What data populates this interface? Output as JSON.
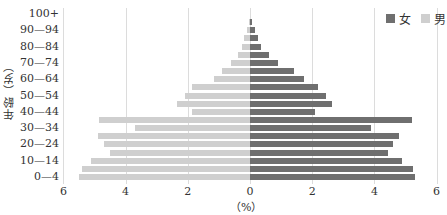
{
  "chart_data": {
    "type": "bar",
    "orientation": "horizontal-population-pyramid",
    "title": "",
    "xlabel": "（%）",
    "ylabel": "年龄（岁）",
    "xlim": [
      -6,
      6
    ],
    "x_ticks": [
      "6",
      "4",
      "2",
      "0",
      "2",
      "4",
      "6"
    ],
    "x_tick_values": [
      -6,
      -4,
      -2,
      0,
      2,
      4,
      6
    ],
    "y_tick_labels": [
      "0—4",
      "10—14",
      "20—24",
      "30—34",
      "40—44",
      "50—54",
      "60—64",
      "70—74",
      "80—84",
      "90—94",
      "100+"
    ],
    "categories": [
      "0—4",
      "5—9",
      "10—14",
      "15—19",
      "20—24",
      "25—29",
      "30—34",
      "35—39",
      "40—44",
      "45—49",
      "50—54",
      "55—59",
      "60—64",
      "65—69",
      "70—74",
      "75—79",
      "80—84",
      "85—89",
      "90—94",
      "95—99",
      "100+"
    ],
    "series": [
      {
        "name": "女",
        "color": "#6f6f6f",
        "side": "right",
        "values": [
          5.3,
          5.25,
          4.9,
          4.45,
          4.6,
          4.8,
          3.9,
          5.2,
          2.1,
          2.65,
          2.45,
          2.2,
          1.75,
          1.4,
          0.9,
          0.6,
          0.35,
          0.25,
          0.15,
          0.05,
          0.0
        ]
      },
      {
        "name": "男",
        "color": "#cfcfcf",
        "side": "left",
        "values": [
          5.5,
          5.4,
          5.1,
          4.5,
          4.7,
          4.9,
          3.7,
          4.85,
          1.85,
          2.35,
          2.1,
          1.85,
          1.15,
          0.9,
          0.6,
          0.4,
          0.25,
          0.2,
          0.1,
          0.02,
          0.0
        ]
      }
    ],
    "grid": {
      "vertical": true,
      "horizontal": false
    },
    "legend_position": "top-right"
  },
  "legend": [
    {
      "label": "女",
      "color": "#6f6f6f"
    },
    {
      "label": "男",
      "color": "#cfcfcf"
    }
  ]
}
